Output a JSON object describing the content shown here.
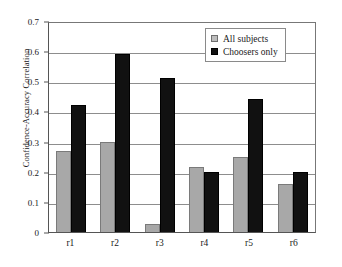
{
  "chart_data": {
    "type": "bar",
    "title": "",
    "xlabel": "",
    "ylabel": "Confidence-Accuracy Correlation",
    "categories": [
      "r1",
      "r2",
      "r3",
      "r4",
      "r5",
      "r6"
    ],
    "series": [
      {
        "name": "All subjects",
        "color": "#a8a8a8",
        "values": [
          0.268,
          0.3,
          0.028,
          0.217,
          0.248,
          0.158
        ]
      },
      {
        "name": "Choosers only",
        "color": "#111111",
        "values": [
          0.42,
          0.59,
          0.51,
          0.2,
          0.44,
          0.198
        ]
      }
    ],
    "ylim": [
      0,
      0.7
    ],
    "ytick_values": [
      0,
      0.1,
      0.2,
      0.3,
      0.4,
      0.5,
      0.6,
      0.7
    ],
    "ytick_labels": [
      "0",
      "0.1",
      "0.2",
      "0.3",
      "0.4",
      "0.5",
      "0.6",
      "0.7"
    ],
    "grid": "horizontal",
    "legend_position": "top-right"
  },
  "legend": {
    "items": [
      {
        "label": "All subjects",
        "swatch": "gray-square-swatch"
      },
      {
        "label": "Choosers only",
        "swatch": "black-square-swatch"
      }
    ]
  }
}
